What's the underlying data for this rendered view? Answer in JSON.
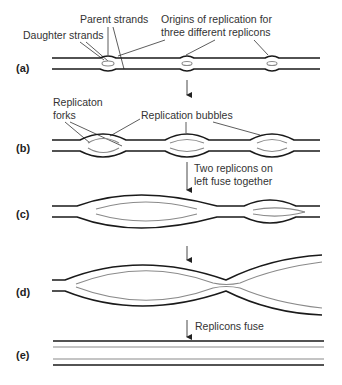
{
  "rows": [
    {
      "id": "a",
      "label": "(a)"
    },
    {
      "id": "b",
      "label": "(b)"
    },
    {
      "id": "c",
      "label": "(c)"
    },
    {
      "id": "d",
      "label": "(d)"
    },
    {
      "id": "e",
      "label": "(e)"
    }
  ],
  "annotations": {
    "parent_strands": "Parent strands",
    "daughter_strands": "Daughter strands",
    "origins_line1": "Origins of replication for",
    "origins_line2": "three different replicons",
    "forks_line1": "Replicaton",
    "forks_line2": "forks",
    "bubbles": "Replication bubbles",
    "fuse_left_line1": "Two replicons on",
    "fuse_left_line2": "left fuse together",
    "replicons_fuse": "Replicons fuse"
  },
  "colors": {
    "parent_strand": "#1a1a1a",
    "daughter_strand": "#8a8a8a",
    "text": "#333333"
  }
}
